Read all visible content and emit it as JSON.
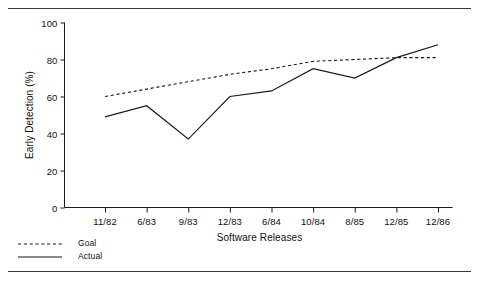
{
  "figure": {
    "rule_top": "",
    "rule_bottom": ""
  },
  "chart_data": {
    "type": "line",
    "title": "",
    "xlabel": "Software Releases",
    "ylabel": "Early Detection (%)",
    "categories": [
      "11/82",
      "6/83",
      "9/83",
      "12/83",
      "6/84",
      "10/84",
      "8/85",
      "12/85",
      "12/86"
    ],
    "series": [
      {
        "name": "Goal",
        "style": "dashed",
        "color": "#1a1a1a",
        "values": [
          60,
          64,
          68,
          72,
          75,
          79,
          80,
          81,
          81
        ]
      },
      {
        "name": "Actual",
        "style": "solid",
        "color": "#1a1a1a",
        "values": [
          49,
          55,
          37,
          60,
          63,
          75,
          70,
          81,
          88
        ]
      }
    ],
    "ylim": [
      0,
      100
    ],
    "yticks": [
      0,
      20,
      40,
      60,
      80,
      100
    ],
    "ytick_labels": [
      "0",
      "20",
      "40",
      "60",
      "80",
      "100"
    ],
    "grid": false,
    "legend_position": "below-left"
  },
  "legend": {
    "entries": [
      {
        "label": "Goal",
        "style": "dashed"
      },
      {
        "label": "Actual",
        "style": "solid"
      }
    ]
  }
}
